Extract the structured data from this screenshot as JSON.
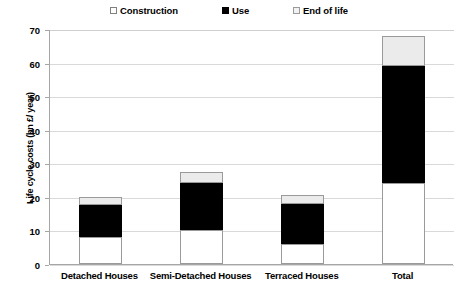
{
  "chart_data": {
    "type": "bar",
    "stacked": true,
    "title": "",
    "xlabel": "",
    "ylabel": "Life cycle costs (bn £/ year)",
    "ylim": [
      0,
      70
    ],
    "ytick_step": 10,
    "yticks": [
      0,
      10,
      20,
      30,
      40,
      50,
      60,
      70
    ],
    "grid": "horizontal",
    "legend_position": "top",
    "categories": [
      "Detached Houses",
      "Semi-Detached Houses",
      "Terraced Houses",
      "Total"
    ],
    "series": [
      {
        "name": "Construction",
        "color": "#ffffff",
        "values": [
          8,
          10,
          6,
          24
        ]
      },
      {
        "name": "Use",
        "color": "#000000",
        "values": [
          9.5,
          14,
          12,
          35
        ]
      },
      {
        "name": "End of life",
        "color": "#ebebeb",
        "values": [
          2.5,
          3.5,
          2.5,
          9
        ]
      }
    ],
    "totals": [
      20,
      27.5,
      20.5,
      68
    ]
  },
  "legend": {
    "items": [
      {
        "label": "Construction",
        "swatch": "construction-swatch"
      },
      {
        "label": "Use",
        "swatch": "use-swatch"
      },
      {
        "label": "End of life",
        "swatch": "end-of-life-swatch"
      }
    ]
  }
}
